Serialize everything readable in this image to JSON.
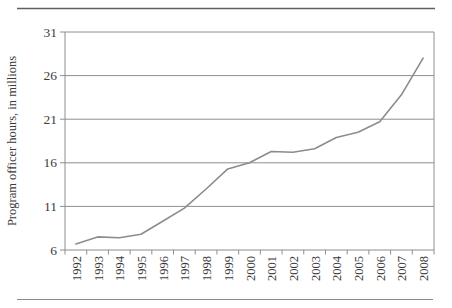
{
  "figure": {
    "background": "#ffffff",
    "top_rule_color": "#5f5f5f",
    "bottom_rule_color": "#8a8a8a"
  },
  "chart_data": {
    "type": "line",
    "title": "",
    "xlabel": "",
    "ylabel": "Program officer hours, in millions",
    "categories": [
      "1992",
      "1993",
      "1994",
      "1995",
      "1996",
      "1997",
      "1998",
      "1999",
      "2000",
      "2001",
      "2002",
      "2003",
      "2004",
      "2005",
      "2006",
      "2007",
      "2008"
    ],
    "values": [
      6.7,
      7.5,
      7.4,
      7.8,
      9.3,
      10.8,
      13.0,
      15.3,
      16.0,
      17.3,
      17.2,
      17.6,
      18.9,
      19.5,
      20.7,
      23.8,
      28.0
    ],
    "yticks": [
      6,
      11,
      16,
      21,
      26,
      31
    ],
    "ylim": [
      6,
      31
    ],
    "grid": "horizontal gridlines at every y tick, plot enclosed in box",
    "legend": "none",
    "x_tick_label_rotation_deg": -90,
    "line_color": "#8c8c8c",
    "grid_color": "#8e8e8e",
    "axis_color": "#8e8e8e",
    "text_color": "#3b3b3b"
  }
}
